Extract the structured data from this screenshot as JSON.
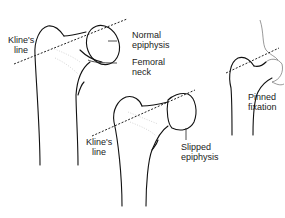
{
  "figure": {
    "panels": [
      {
        "id": "normal",
        "labels": {
          "line": "Kline's\nline",
          "epiphysis": "Normal\nepiphysis",
          "neck": "Femoral\nneck"
        }
      },
      {
        "id": "slipped",
        "labels": {
          "line": "Kline's\nline",
          "epiphysis": "Slipped\nepiphysis"
        }
      },
      {
        "id": "pinned",
        "labels": {
          "fixation": "Pinned\nfixation"
        }
      }
    ]
  },
  "colors": {
    "line_art": "#111111",
    "background": "#ffffff"
  }
}
